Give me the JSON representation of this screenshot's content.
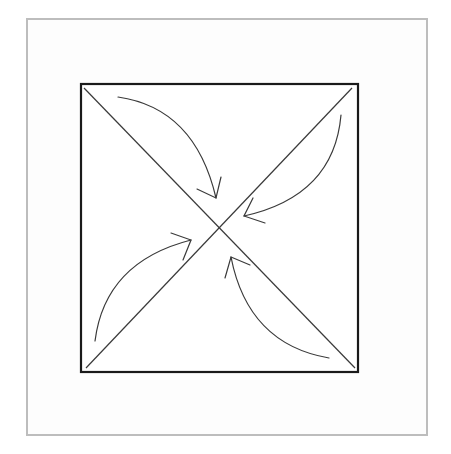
{
  "diagram": {
    "type": "origami-fold-corners-to-center",
    "frame_color": "#bdbdbd",
    "square_color": "#1a1a1a",
    "line_color": "#333333",
    "arrow_color": "#3a3a3a",
    "square": {
      "x": 80,
      "y": 84,
      "width": 279,
      "height": 288
    },
    "center": {
      "x": 219,
      "y": 229
    },
    "arrows": [
      {
        "name": "top-left-to-center",
        "start": [
          118,
          97
        ],
        "tip": [
          216,
          198
        ]
      },
      {
        "name": "top-right-to-center",
        "start": [
          341,
          115
        ],
        "tip": [
          244,
          216
        ]
      },
      {
        "name": "bottom-left-to-center",
        "start": [
          95,
          341
        ],
        "tip": [
          191,
          240
        ]
      },
      {
        "name": "bottom-right-to-center",
        "start": [
          329,
          358
        ],
        "tip": [
          231,
          257
        ]
      }
    ]
  }
}
